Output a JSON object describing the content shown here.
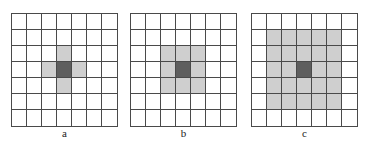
{
  "diagram": {
    "grid_size": 7,
    "colors": {
      "background": "#ffffff",
      "line": "#4a4a4a",
      "neighbor": "#cfcfcf",
      "center": "#5e5e5e"
    },
    "panels": [
      {
        "label": "a",
        "description": "4-neighborhood (von Neumann)",
        "center": [
          3,
          3
        ],
        "neighbors": [
          [
            2,
            3
          ],
          [
            3,
            2
          ],
          [
            3,
            4
          ],
          [
            4,
            3
          ]
        ]
      },
      {
        "label": "b",
        "description": "8-neighborhood (3x3 Moore)",
        "center": [
          3,
          3
        ],
        "neighbors": [
          [
            2,
            2
          ],
          [
            2,
            3
          ],
          [
            2,
            4
          ],
          [
            3,
            2
          ],
          [
            3,
            4
          ],
          [
            4,
            2
          ],
          [
            4,
            3
          ],
          [
            4,
            4
          ]
        ]
      },
      {
        "label": "c",
        "description": "24-neighborhood (5x5)",
        "center": [
          3,
          3
        ],
        "neighbors": "rows 1-5, cols 1-5 except center"
      }
    ]
  }
}
